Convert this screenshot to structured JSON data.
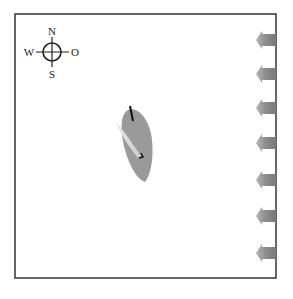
{
  "diagram": {
    "compass": {
      "north": "N",
      "south": "S",
      "west": "W",
      "east": "O"
    },
    "wind": {
      "direction": "from east (arrows pointing west)",
      "arrow_count": 7,
      "arrow_color": "#8a8a8a"
    },
    "boat": {
      "hull_color": "#9a9a9a",
      "sail_color": "#d8d8d8",
      "mast_color": "#111111"
    },
    "frame_color": "#333333"
  }
}
